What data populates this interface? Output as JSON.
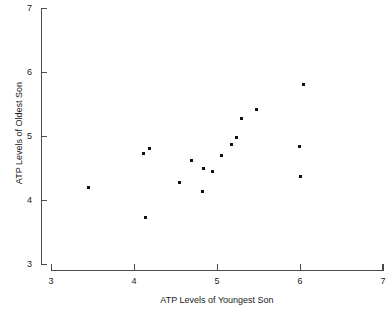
{
  "chart_data": {
    "type": "scatter",
    "title": "",
    "xlabel": "ATP Levels of Youngest Son",
    "ylabel": "ATP Levels of Oldest Son",
    "xlim": [
      3,
      7
    ],
    "ylim": [
      3,
      7
    ],
    "xticks": [
      3,
      4,
      5,
      6,
      7
    ],
    "yticks": [
      3,
      4,
      5,
      6,
      7
    ],
    "xtick_labels": [
      "3",
      "4",
      "5",
      "6",
      "7"
    ],
    "ytick_labels": [
      "3",
      "4",
      "5",
      "6",
      "7"
    ],
    "grid": false,
    "legend": null,
    "marker": "filled-square",
    "marker_color": "#111111",
    "axis_color": "#4a4a4a",
    "background_color": "#ffffff",
    "points": [
      {
        "x": 3.45,
        "y": 4.2
      },
      {
        "x": 4.11,
        "y": 4.73
      },
      {
        "x": 4.19,
        "y": 4.8
      },
      {
        "x": 4.14,
        "y": 3.73
      },
      {
        "x": 4.55,
        "y": 4.27
      },
      {
        "x": 4.69,
        "y": 4.62
      },
      {
        "x": 4.84,
        "y": 4.5
      },
      {
        "x": 4.94,
        "y": 4.44
      },
      {
        "x": 4.82,
        "y": 4.13
      },
      {
        "x": 5.05,
        "y": 4.7
      },
      {
        "x": 5.17,
        "y": 4.86
      },
      {
        "x": 5.23,
        "y": 4.97
      },
      {
        "x": 5.29,
        "y": 5.28
      },
      {
        "x": 5.48,
        "y": 5.41
      },
      {
        "x": 5.99,
        "y": 4.84
      },
      {
        "x": 6.04,
        "y": 5.81
      },
      {
        "x": 6.0,
        "y": 4.36
      }
    ]
  },
  "axes": {
    "x_title": "ATP Levels of Youngest Son",
    "y_title": "ATP Levels of Oldest Son"
  }
}
